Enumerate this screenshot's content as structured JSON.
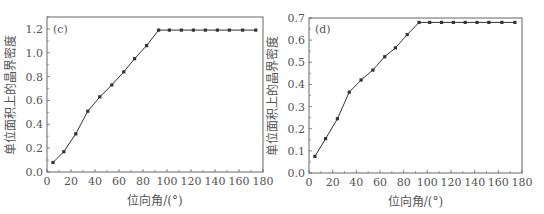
{
  "chart_data": [
    {
      "type": "line",
      "panel_label": "(c)",
      "xlabel": "位向角/(°)",
      "ylabel": "单位面积上的晶界密度",
      "xlim": [
        0,
        180
      ],
      "ylim": [
        0,
        1.3
      ],
      "xticks": [
        "0",
        "20",
        "40",
        "60",
        "80",
        "100",
        "120",
        "140",
        "160",
        "180"
      ],
      "yticks": [
        "0.0",
        "0.2",
        "0.4",
        "0.6",
        "0.8",
        "1.0",
        "1.2"
      ],
      "ytick_values": [
        0,
        0.2,
        0.4,
        0.6,
        0.8,
        1.0,
        1.2
      ],
      "grid": false,
      "series": [
        {
          "name": "(c)",
          "x": [
            5,
            14,
            24,
            34,
            44,
            54,
            64,
            73,
            83,
            93,
            102,
            112,
            122,
            132,
            142,
            152,
            163,
            174
          ],
          "y": [
            0.08,
            0.17,
            0.32,
            0.51,
            0.63,
            0.73,
            0.84,
            0.95,
            1.06,
            1.19,
            1.19,
            1.19,
            1.19,
            1.19,
            1.19,
            1.19,
            1.19,
            1.19
          ]
        }
      ],
      "box": {
        "left": 47,
        "right": 263,
        "top": 17,
        "bottom": 172
      }
    },
    {
      "type": "line",
      "panel_label": "(d)",
      "xlabel": "位向角/(°)",
      "ylabel": "单位面积上的晶界密度",
      "xlim": [
        0,
        180
      ],
      "ylim": [
        0,
        0.7
      ],
      "xticks": [
        "0",
        "20",
        "40",
        "60",
        "80",
        "100",
        "120",
        "140",
        "160",
        "180"
      ],
      "yticks": [
        "0.0",
        "0.1",
        "0.2",
        "0.3",
        "0.4",
        "0.5",
        "0.6",
        "0.7"
      ],
      "ytick_values": [
        0,
        0.1,
        0.2,
        0.3,
        0.4,
        0.5,
        0.6,
        0.7
      ],
      "grid": false,
      "series": [
        {
          "name": "(d)",
          "x": [
            5,
            14,
            24,
            34,
            44,
            54,
            64,
            73,
            83,
            93,
            102,
            112,
            122,
            132,
            142,
            152,
            163,
            174
          ],
          "y": [
            0.075,
            0.155,
            0.245,
            0.365,
            0.42,
            0.465,
            0.525,
            0.565,
            0.625,
            0.68,
            0.68,
            0.68,
            0.68,
            0.68,
            0.68,
            0.68,
            0.68,
            0.68
          ]
        }
      ],
      "box": {
        "left": 309,
        "right": 522,
        "top": 18,
        "bottom": 173
      }
    }
  ]
}
